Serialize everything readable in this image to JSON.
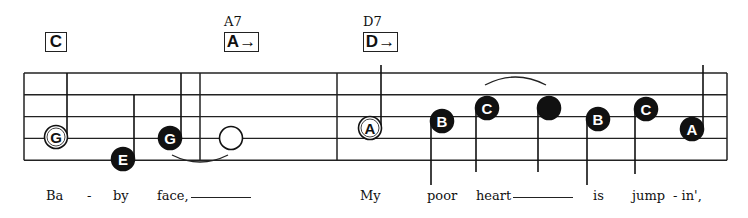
{
  "chords": [
    {
      "name": "",
      "box": "C",
      "arrow": false,
      "x": 45
    },
    {
      "name": "A7",
      "box": "A",
      "arrow": true,
      "x": 224
    },
    {
      "name": "D7",
      "box": "D",
      "arrow": true,
      "x": 363
    }
  ],
  "staff": {
    "left": 24,
    "right": 727,
    "top": 73,
    "spacing": 21.8,
    "barlines": [
      200,
      337
    ],
    "color": "#222222"
  },
  "notes": [
    {
      "letter": "G",
      "x": 56,
      "y": 137,
      "style": "open-letter",
      "stem": "up",
      "stemTop": 73
    },
    {
      "letter": "E",
      "x": 123,
      "y": 159,
      "style": "filled",
      "stem": "up",
      "stemTop": 95
    },
    {
      "letter": "G",
      "x": 170,
      "y": 138,
      "style": "filled",
      "stem": "up",
      "stemTop": 73
    },
    {
      "letter": "",
      "x": 231,
      "y": 138,
      "style": "open-blank",
      "stem": "none"
    },
    {
      "letter": "A",
      "x": 370,
      "y": 128,
      "style": "open-letter",
      "stem": "up",
      "stemTop": 65
    },
    {
      "letter": "B",
      "x": 442,
      "y": 121,
      "style": "filled",
      "stem": "down",
      "stemBottom": 185
    },
    {
      "letter": "C",
      "x": 487,
      "y": 108,
      "style": "filled",
      "stem": "down",
      "stemBottom": 172
    },
    {
      "letter": "",
      "x": 549,
      "y": 108,
      "style": "filled-blank",
      "stem": "down",
      "stemBottom": 172
    },
    {
      "letter": "B",
      "x": 598,
      "y": 119,
      "style": "filled",
      "stem": "down",
      "stemBottom": 185
    },
    {
      "letter": "C",
      "x": 646,
      "y": 109,
      "style": "filled",
      "stem": "down",
      "stemBottom": 174
    },
    {
      "letter": "A",
      "x": 692,
      "y": 129,
      "style": "filled",
      "stem": "up",
      "stemTop": 65
    }
  ],
  "ties": [
    {
      "from": 172,
      "to": 228,
      "y": 155,
      "dir": "down"
    },
    {
      "from": 485,
      "to": 546,
      "y": 85,
      "dir": "up"
    }
  ],
  "lyrics": [
    {
      "text": "Ba",
      "x": 46
    },
    {
      "text": "-",
      "x": 87
    },
    {
      "text": "by",
      "x": 113
    },
    {
      "text": "face,",
      "x": 157,
      "extender": true
    },
    {
      "text": "My",
      "x": 360
    },
    {
      "text": "poor",
      "x": 427
    },
    {
      "text": "heart",
      "x": 476,
      "extender": true
    },
    {
      "text": "is",
      "x": 593
    },
    {
      "text": "jump",
      "x": 632
    },
    {
      "text": "- in',",
      "x": 673
    }
  ]
}
